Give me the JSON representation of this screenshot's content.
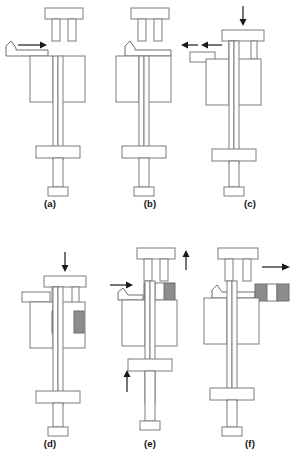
{
  "figure": {
    "background_color": "#ffffff",
    "line_color": "#7c7c7c",
    "arrow_color": "#1a1a1a",
    "compact_fill_color": "#8d8d8d",
    "panel_count": 6
  },
  "panels": [
    {
      "id": "a",
      "label": "(a)",
      "row": 1,
      "column": 1,
      "description": "Feed shoe advancing toward die cavity",
      "upper_punch_position": "raised",
      "feed_shoe_position": "left-entering",
      "compact_visible": false,
      "arrows": [
        {
          "name": "feed-shoe-advance-arrow",
          "direction": "right",
          "label": ""
        }
      ]
    },
    {
      "id": "b",
      "label": "(b)",
      "row": 1,
      "column": 2,
      "description": "Die cavity filled with powder, feed shoe over cavity",
      "upper_punch_position": "raised",
      "feed_shoe_position": "over-cavity",
      "compact_visible": false,
      "arrows": []
    },
    {
      "id": "c",
      "label": "(c)",
      "row": 1,
      "column": 3,
      "description": "Feed shoe retracts, upper punch descends",
      "upper_punch_position": "descending",
      "feed_shoe_position": "retracting-left",
      "compact_visible": false,
      "arrows": [
        {
          "name": "upper-punch-down-arrow",
          "direction": "down",
          "label": ""
        },
        {
          "name": "feed-shoe-retract-arrow",
          "direction": "left",
          "label": ""
        }
      ]
    },
    {
      "id": "d",
      "label": "(d)",
      "row": 2,
      "column": 1,
      "description": "Compaction of powder between upper and lower punches",
      "upper_punch_position": "lowered",
      "feed_shoe_position": "left-clear",
      "compact_visible": true,
      "arrows": [
        {
          "name": "compaction-force-arrow",
          "direction": "down",
          "label": ""
        }
      ]
    },
    {
      "id": "e",
      "label": "(e)",
      "row": 2,
      "column": 2,
      "description": "Ejection: lower punch rises, upper punch withdraws, compact lifted",
      "upper_punch_position": "rising",
      "feed_shoe_position": "left-entering",
      "compact_visible": true,
      "arrows": [
        {
          "name": "upper-punch-up-arrow",
          "direction": "up",
          "label": ""
        },
        {
          "name": "lower-punch-up-arrow",
          "direction": "up",
          "label": ""
        },
        {
          "name": "feed-shoe-advance-arrow",
          "direction": "right",
          "label": ""
        }
      ]
    },
    {
      "id": "f",
      "label": "(f)",
      "row": 2,
      "column": 3,
      "description": "Feed shoe pushes finished compact off the die",
      "upper_punch_position": "raised",
      "feed_shoe_position": "over-cavity",
      "compact_visible": true,
      "arrows": [
        {
          "name": "part-removal-arrow",
          "direction": "right",
          "label": ""
        }
      ]
    }
  ]
}
